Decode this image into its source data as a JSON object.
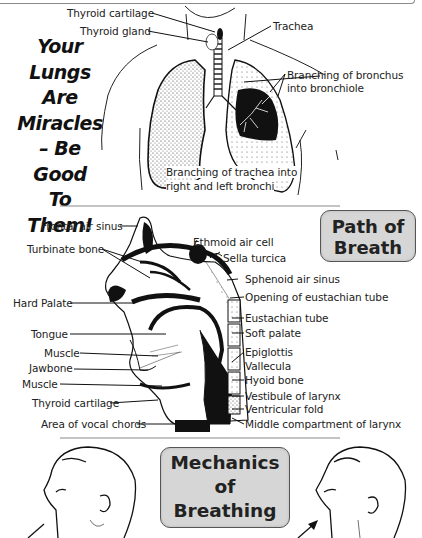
{
  "slogan": {
    "lines": [
      "Your",
      "Lungs",
      "Are",
      "Miracles",
      "– Be",
      "Good",
      "To",
      "Them!"
    ]
  },
  "lungs_section": {
    "labels": {
      "thyroid_cartilage": "Thyroid cartilage",
      "thyroid_gland": "Thyroid gland",
      "trachea": "Trachea",
      "bronchus_1": "Branching of bronchus",
      "bronchus_2": "into bronchiole",
      "trachea_branch_1": "Branching of trachea into",
      "trachea_branch_2": "right and left bronchi"
    }
  },
  "path_section": {
    "title_line1": "Path of",
    "title_line2": "Breath",
    "left_labels": {
      "frontal_air_sinus": "Frontal air sinus",
      "turbinate_bone": "Turbinate bone",
      "hard_palate": "Hard Palate",
      "tongue": "Tongue",
      "muscle_1": "Muscle",
      "jawbone": "Jawbone",
      "muscle_2": "Muscle",
      "thyroid_cartilage": "Thyroid cartilage",
      "vocal_chords": "Area of vocal chords"
    },
    "right_labels": {
      "ethmoid_air_cell": "Ethmoid air cell",
      "sella_turcica": "Sella turcica",
      "sphenoid_air_sinus": "Sphenoid air sinus",
      "opening_eustachian": "Opening of eustachian tube",
      "eustachian_tube": "Eustachian tube",
      "soft_palate": "Soft palate",
      "epiglottis": "Epiglottis",
      "vallecula": "Vallecula",
      "hyoid_bone": "Hyoid bone",
      "vestibule_larynx": "Vestibule of larynx",
      "ventricular_fold": "Ventricular fold",
      "middle_compartment": "Middle compartment of larynx"
    }
  },
  "mechanics_section": {
    "title_line1": "Mechanics",
    "title_line2": "of",
    "title_line3": "Breathing"
  },
  "colors": {
    "title_box_bg": "#d6d6d6",
    "ink": "#111111",
    "divider": "#888888"
  }
}
